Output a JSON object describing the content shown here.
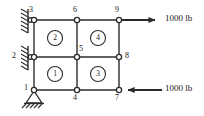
{
  "figure": {
    "type": "finite-element-mesh-diagram",
    "title": "",
    "stroke_color": "#2b2b2b",
    "node_fill_color": "#ffffff",
    "text_color": "#1a1a1a"
  },
  "nodes": [
    {
      "id": "1",
      "label": "1",
      "x": 34,
      "y": 90,
      "label_x": 24,
      "label_y": 85
    },
    {
      "id": "2",
      "label": "2",
      "x": 34,
      "y": 57,
      "label_x": 13,
      "label_y": 53
    },
    {
      "id": "3",
      "label": "3",
      "x": 34,
      "y": 20,
      "label_x": 29,
      "label_y": 7
    },
    {
      "id": "4",
      "label": "4",
      "x": 77,
      "y": 90,
      "label_x": 74,
      "label_y": 95
    },
    {
      "id": "5",
      "label": "5",
      "x": 77,
      "y": 57,
      "label_x": 80,
      "label_y": 45
    },
    {
      "id": "6",
      "label": "6",
      "x": 77,
      "y": 20,
      "label_x": 74,
      "label_y": 7
    },
    {
      "id": "7",
      "label": "7",
      "x": 119,
      "y": 90,
      "label_x": 116,
      "label_y": 95
    },
    {
      "id": "8",
      "label": "8",
      "x": 119,
      "y": 57,
      "label_x": 124,
      "label_y": 53
    },
    {
      "id": "9",
      "label": "9",
      "x": 119,
      "y": 20,
      "label_x": 116,
      "label_y": 7
    }
  ],
  "elements": [
    {
      "id": "1",
      "label": "1",
      "cx": 55,
      "cy": 74
    },
    {
      "id": "2",
      "label": "2",
      "cx": 55,
      "cy": 38
    },
    {
      "id": "3",
      "label": "3",
      "cx": 98,
      "cy": 74
    },
    {
      "id": "4",
      "label": "4",
      "cx": 98,
      "cy": 38
    }
  ],
  "supports": [
    {
      "at_node": "3",
      "kind": "roller-vertical-wall",
      "wall_x": 28,
      "wall_y_top": 10,
      "wall_y_bottom": 32
    },
    {
      "at_node": "2",
      "kind": "roller-vertical-wall",
      "wall_x": 28,
      "wall_y_top": 46,
      "wall_y_bottom": 68
    },
    {
      "at_node": "1",
      "kind": "pin-ground",
      "ground_y": 104
    }
  ],
  "loads": [
    {
      "id": "load-top",
      "at_node": "9",
      "direction": "right",
      "magnitude": "1000",
      "unit": "lb",
      "text": "1000 lb",
      "arrow_start_x": 119,
      "arrow_end_x": 162,
      "arrow_y": 20,
      "label_x": 166,
      "label_y": 15
    },
    {
      "id": "load-bottom",
      "at_node": "7",
      "direction": "left",
      "magnitude": "1000",
      "unit": "lb",
      "text": "1000 lb",
      "arrow_start_x": 162,
      "arrow_end_x": 119,
      "arrow_y": 90,
      "label_x": 166,
      "label_y": 85
    }
  ]
}
